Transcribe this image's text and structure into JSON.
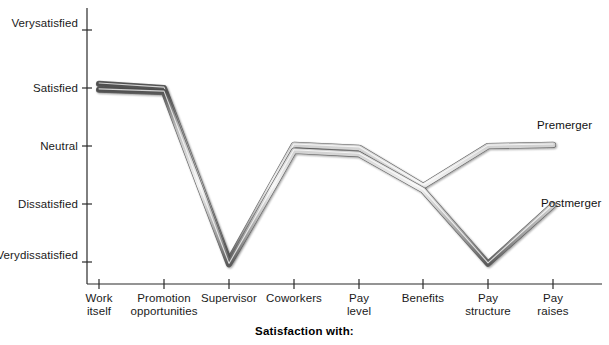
{
  "chart_data": {
    "type": "line",
    "title": "",
    "xlabel": "Satisfaction with:",
    "ylabel": "",
    "grid": false,
    "legend_position": "inline-right",
    "categories": [
      "Work itself",
      "Promotion opportunities",
      "Supervisor",
      "Coworkers",
      "Pay level",
      "Benefits",
      "Pay structure",
      "Pay raises"
    ],
    "category_lines": [
      [
        "Work",
        "itself"
      ],
      [
        "Promotion",
        "opportunities"
      ],
      [
        "Supervisor",
        ""
      ],
      [
        "Coworkers",
        ""
      ],
      [
        "Pay",
        "level"
      ],
      [
        "Benefits",
        ""
      ],
      [
        "Pay",
        "structure"
      ],
      [
        "Pay",
        "raises"
      ]
    ],
    "y_tick_labels": [
      [
        "Very",
        "satisfied"
      ],
      [
        "Satisfied",
        ""
      ],
      [
        "Neutral",
        ""
      ],
      [
        "Dissatisfied",
        ""
      ],
      [
        "Very",
        "dissatisfied"
      ]
    ],
    "y_scale_values": [
      5,
      4,
      3,
      2,
      1
    ],
    "ylim": [
      1,
      5
    ],
    "series": [
      {
        "name": "Premerger",
        "color": "#8c8c8c",
        "values": [
          4.07,
          4.0,
          1.02,
          3.02,
          2.97,
          2.31,
          3.0,
          3.02
        ]
      },
      {
        "name": "Postmerger",
        "color": "#8c8c8c",
        "values": [
          3.97,
          3.93,
          0.96,
          2.92,
          2.86,
          2.24,
          0.97,
          1.98
        ]
      }
    ],
    "annotations": [
      {
        "text": "Premerger",
        "x": 537,
        "y": 119
      },
      {
        "text": "Postmerger",
        "x": 541,
        "y": 197
      }
    ]
  },
  "axis": {
    "bottom_title": "Satisfaction with:",
    "origin_x": 87,
    "plot_right": 602,
    "top_y": 8,
    "bottom_y": 284,
    "tick_x": [
      99,
      164,
      229,
      294,
      359,
      423,
      488,
      553
    ],
    "tick_y": [
      30,
      88,
      146,
      204,
      262
    ]
  }
}
